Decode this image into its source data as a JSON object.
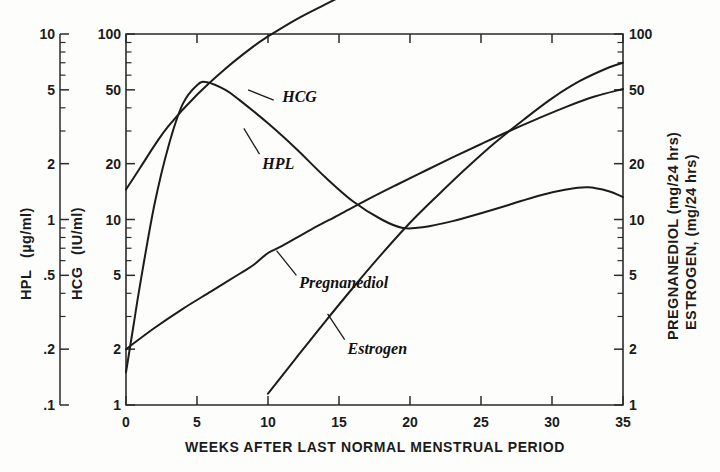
{
  "figure": {
    "kind": "scanned-line-chart",
    "background": "#fdfdfc",
    "ink_color": "#1c1c1c"
  },
  "chart_data": {
    "type": "line",
    "title": "",
    "subtitle": "",
    "xlabel": "WEEKS AFTER LAST NORMAL MENSTRUAL PERIOD",
    "xlim": [
      0,
      35
    ],
    "xticks": [
      0,
      5,
      10,
      15,
      20,
      25,
      30,
      35
    ],
    "xticklabels": [
      "0",
      "5",
      "10",
      "15",
      "20",
      "25",
      "30",
      "35"
    ],
    "grid": false,
    "legend_position": "inline-annotations",
    "yscale": "log",
    "axes": [
      {
        "id": "hpl-axis",
        "position": "left-outer",
        "label_line1": "HPL",
        "label_line2": "(µg/ml)",
        "label_full": "HPL (µg/ml)",
        "units": "µg/ml",
        "ylim": [
          0.1,
          10
        ],
        "ticks": [
          10,
          5,
          2,
          1,
          0.5,
          0.2,
          0.1
        ],
        "ticklabels": [
          "10",
          "5",
          "2",
          "1",
          ".5",
          ".2",
          ".1"
        ]
      },
      {
        "id": "hcg-axis",
        "position": "left-inner",
        "label_line1": "HCG",
        "label_line2": "(IU/ml)",
        "label_full": "HCG (IU/ml)",
        "units": "IU/ml",
        "ylim": [
          1,
          100
        ],
        "ticks": [
          100,
          50,
          20,
          10,
          5,
          2,
          1
        ],
        "ticklabels": [
          "100",
          "50",
          "20",
          "10",
          "5",
          "2",
          "1"
        ]
      },
      {
        "id": "pregnanediol-estrogen-axis",
        "position": "right",
        "label_line1": "PREGNANEDIOL  (mg/24 hrs)",
        "label_line2": "ESTROGEN, (mg/24 hrs)",
        "label_full": "PREGNANEDIOL (mg/24 hrs)  ESTROGEN, (mg/24 hrs)",
        "units": "mg/24 hrs",
        "ylim": [
          1,
          100
        ],
        "ticks": [
          100,
          50,
          20,
          10,
          5,
          2,
          1
        ],
        "ticklabels": [
          "100",
          "50",
          "20",
          "10",
          "5",
          "2",
          "1"
        ]
      }
    ],
    "series": [
      {
        "name": "HCG",
        "label": "HCG",
        "axis": "hcg-axis",
        "units": "IU/ml",
        "label_pos": {
          "x": 11.0,
          "y": 46
        },
        "leader": [
          {
            "x": 10.4,
            "y": 44
          },
          {
            "x": 8.6,
            "y": 50
          }
        ],
        "x": [
          0,
          0.5,
          1,
          2,
          3,
          4,
          5,
          5.7,
          7,
          8,
          10,
          12,
          14,
          16,
          18,
          19.5,
          21,
          23,
          25,
          27,
          29,
          31,
          32.5,
          34,
          35
        ],
        "values": [
          1.5,
          2.6,
          4.5,
          12,
          25,
          42,
          53,
          55,
          50,
          44,
          33,
          24,
          17,
          12.5,
          10.0,
          9.0,
          9.1,
          9.8,
          10.8,
          12.0,
          13.4,
          14.5,
          14.9,
          14.2,
          13.2
        ]
      },
      {
        "name": "HPL",
        "label": "HPL",
        "axis": "hpl-axis",
        "units": "µg/ml",
        "label_pos": {
          "x": 9.6,
          "y": 2.0
        },
        "leader": [
          {
            "x": 9.4,
            "y": 2.25
          },
          {
            "x": 8.3,
            "y": 3.1
          }
        ],
        "x": [
          0,
          1,
          2,
          3,
          5,
          7,
          9,
          10,
          12,
          14,
          16,
          18,
          20,
          22,
          24,
          26,
          28,
          30,
          32,
          33.5,
          35
        ],
        "values": [
          1.45,
          1.9,
          2.5,
          3.2,
          4.7,
          6.5,
          8.6,
          9.7,
          12.0,
          14.4,
          17.2,
          20.5,
          24.0,
          28.0,
          32.0,
          36.0,
          40.0,
          43.0,
          45.2,
          45.6,
          44.5
        ]
      },
      {
        "name": "Pregnanediol",
        "label": "Pregnanediol",
        "axis": "pregnanediol-estrogen-axis",
        "units": "mg/24 hrs",
        "label_pos": {
          "x": 12.2,
          "y": 4.55
        },
        "leader": [
          {
            "x": 12.0,
            "y": 5.0
          },
          {
            "x": 10.6,
            "y": 6.8
          }
        ],
        "x": [
          0,
          2,
          4,
          6,
          8,
          9,
          10,
          11,
          13,
          15,
          17,
          19,
          21,
          23,
          25,
          27,
          29,
          31,
          33,
          35
        ],
        "values": [
          2.0,
          2.6,
          3.3,
          4.1,
          5.1,
          5.7,
          6.6,
          7.2,
          8.8,
          10.6,
          12.8,
          15.3,
          18.2,
          21.6,
          25.5,
          30.0,
          35.0,
          40.5,
          46.0,
          50.5
        ]
      },
      {
        "name": "Estrogen",
        "label": "Estrogen",
        "axis": "pregnanediol-estrogen-axis",
        "units": "mg/24 hrs",
        "label_pos": {
          "x": 15.6,
          "y": 2.0
        },
        "leader": [
          {
            "x": 15.4,
            "y": 2.25
          },
          {
            "x": 14.2,
            "y": 3.1
          }
        ],
        "x": [
          10,
          12,
          14,
          16,
          18,
          20,
          22,
          24,
          26,
          28,
          30,
          32,
          34,
          35
        ],
        "values": [
          1.15,
          1.8,
          2.8,
          4.3,
          6.5,
          9.6,
          13.6,
          19.0,
          26.0,
          34.5,
          45.0,
          56.0,
          66.0,
          70.0
        ]
      }
    ]
  }
}
